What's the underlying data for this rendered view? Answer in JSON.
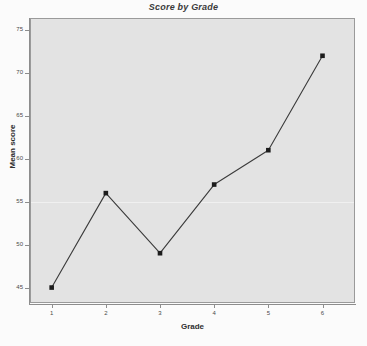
{
  "chart_data": {
    "type": "line",
    "title": "Score by Grade",
    "xlabel": "Grade",
    "ylabel": "Mean score",
    "x": [
      1,
      2,
      3,
      4,
      5,
      6
    ],
    "values": [
      45,
      56,
      49,
      57,
      61,
      72
    ],
    "categories": [
      "1",
      "2",
      "3",
      "4",
      "5",
      "6"
    ],
    "xtick_labels": [
      "1",
      "2",
      "3",
      "4",
      "5",
      "6"
    ],
    "ytick_labels": [
      "45",
      "50",
      "55",
      "60",
      "65",
      "70",
      "75"
    ],
    "yticks": [
      45,
      50,
      55,
      60,
      65,
      70,
      75
    ],
    "xlim": [
      0.6,
      6.6
    ],
    "ylim": [
      43.2,
      76.4
    ],
    "grid": true,
    "gridlines_y": [
      55
    ],
    "legend": null,
    "marker": "filled-square",
    "line_color": "#3b3b3b",
    "marker_color": "#1c1c1c",
    "plot_background": "#e3e3e3",
    "figure_background": "#fbfbfb",
    "gridline_color": "#f2f2f2",
    "axis_color": "#8d8d8d"
  },
  "colors": {
    "title": "#3a3a3a",
    "axis_title": "#2f2f2f",
    "tick_label": "#4a4a4a"
  }
}
